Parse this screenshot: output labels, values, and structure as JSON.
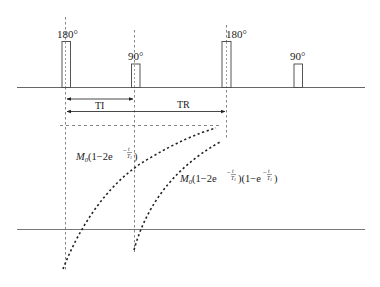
{
  "diagram": {
    "type": "MRI inversion recovery pulse sequence timing diagram",
    "pulses": [
      {
        "label": "180°",
        "flip_angle": 180
      },
      {
        "label": "90°",
        "flip_angle": 90
      },
      {
        "label": "180°",
        "flip_angle": 180
      },
      {
        "label": "90°",
        "flip_angle": 90
      }
    ],
    "intervals": {
      "ti_label": "TI",
      "tr_label": "TR"
    },
    "curves": {
      "first": {
        "coef": "M",
        "coef_sub": "0",
        "body": "(1−2e",
        "exp": "−",
        "exp_num": "t",
        "exp_den": "T",
        "exp_den_sub": "1",
        "close": ")"
      },
      "second": {
        "coef": "M",
        "coef_sub": "0",
        "body": "(1−2e",
        "exp": "−",
        "exp_num": "t",
        "exp_den": "T",
        "exp_den_sub": "1",
        "mid": ")(1−e",
        "exp2": "−",
        "exp2_num": "t",
        "exp2_den": "T",
        "exp2_den_sub": "1",
        "close": ")"
      }
    },
    "colors": {
      "line": "#555555",
      "text": "#222222",
      "curve": "#222222"
    }
  }
}
